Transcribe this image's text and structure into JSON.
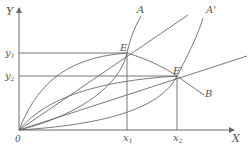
{
  "diagram": {
    "axes": {
      "y_label": "Y",
      "x_label": "X",
      "origin_label": "0"
    },
    "y_ticks": [
      {
        "label": "y",
        "sub": "1"
      },
      {
        "label": "y",
        "sub": "2"
      }
    ],
    "x_ticks": [
      {
        "label": "x",
        "sub": "1"
      },
      {
        "label": "x",
        "sub": "2"
      }
    ],
    "points": {
      "E": "E",
      "E_prime": "E'"
    },
    "curves": {
      "A": "A",
      "A_prime": "A'",
      "B": "B"
    },
    "colors": {
      "line": "#6a6a6a",
      "text": "#555555"
    }
  }
}
